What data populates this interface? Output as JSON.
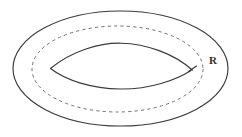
{
  "figure": {
    "background_color": "#ffffff",
    "stroke_color": "#3a3a3a",
    "dashed_stroke_color": "#6f6f6f"
  },
  "labels": {
    "radius": "R"
  },
  "shapes": {
    "outer_ellipse": {
      "name": "outer-ellipse",
      "center_x": 120.5,
      "center_y": 68.5,
      "radius_x": 107.5,
      "radius_y": 57.5,
      "style": "solid"
    },
    "dashed_ellipse": {
      "name": "hidden-inner-ellipse",
      "center_x": 117.5,
      "center_y": 69,
      "radius_x": 85.5,
      "radius_y": 43,
      "style": "dashed"
    },
    "inner_lens": {
      "name": "inner-hole-lens",
      "left_vertex_x": 50,
      "left_vertex_y": 68,
      "right_vertex_x": 192,
      "right_vertex_y": 70,
      "top_peak_y": 43,
      "bottom_peak_y": 89,
      "style": "solid"
    }
  }
}
